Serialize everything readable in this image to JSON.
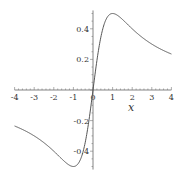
{
  "chart_data": {
    "type": "line",
    "title": "",
    "xlabel": "x",
    "ylabel": "",
    "xlim": [
      -4,
      4
    ],
    "ylim": [
      -0.5,
      0.5
    ],
    "grid": false,
    "legend": null,
    "x_ticks": [
      -4,
      -3,
      -2,
      -1,
      0,
      1,
      2,
      3,
      4
    ],
    "x_tick_labels": [
      "-4",
      "-3",
      "-2",
      "-1",
      "0",
      "1",
      "2",
      "3",
      "4"
    ],
    "y_ticks": [
      0.4,
      0.2,
      -0.2,
      -0.4
    ],
    "y_tick_labels": [
      "0.4",
      "0.2",
      "-0.2",
      "-0.4"
    ],
    "series": [
      {
        "name": "x/(1+x^2)",
        "color": "#555555",
        "x": [
          -4,
          -3.5,
          -3,
          -2.5,
          -2,
          -1.5,
          -1,
          -0.5,
          0,
          0.5,
          1,
          1.5,
          2,
          2.5,
          3,
          3.5,
          4
        ],
        "y": [
          -0.235,
          -0.264,
          -0.3,
          -0.345,
          -0.4,
          -0.462,
          -0.5,
          -0.4,
          0,
          0.4,
          0.5,
          0.462,
          0.4,
          0.345,
          0.3,
          0.264,
          0.235
        ]
      }
    ]
  }
}
